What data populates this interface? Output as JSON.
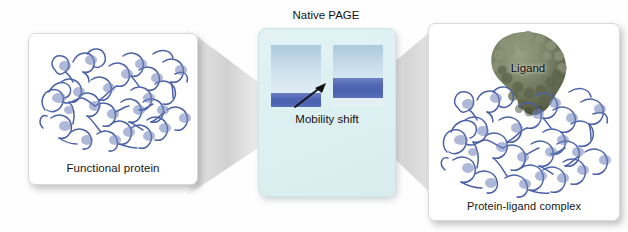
{
  "figure": {
    "background": "#fefefe"
  },
  "panels": {
    "left": {
      "label": "Functional protein",
      "structure_icon": "protein-ribbon-icon",
      "ribbon_color": "#4c62a8"
    },
    "center": {
      "title": "Native PAGE",
      "panel_color": "#ddf0f2",
      "annotation": "Mobility shift",
      "arrow_icon": "mobility-shift-arrow-icon",
      "lanes": [
        {
          "name": "lane-1",
          "description": "unbound protein",
          "smear_top_color": "#aec9dd",
          "smear_bottom_color": "#e6f1f6",
          "band_color": "#4f66b4",
          "band_position": "bottom"
        },
        {
          "name": "lane-2",
          "description": "protein-ligand complex",
          "smear_top_color": "#aec9dd",
          "smear_bottom_color": "#e6f1f6",
          "band_color": "#4f66b4",
          "band_position": "shifted-up"
        }
      ]
    },
    "right": {
      "label": "Protein-ligand complex",
      "ligand_label": "Ligand",
      "structure_icon": "protein-ribbon-icon",
      "ligand_icon": "ligand-surface-blob-icon",
      "ribbon_color": "#4c62a8",
      "ligand_color": "#6b7358"
    }
  },
  "connectors": {
    "left_wedge": "funnel-wedge-left",
    "right_wedge": "funnel-wedge-right",
    "color": "#d2d2d2"
  }
}
